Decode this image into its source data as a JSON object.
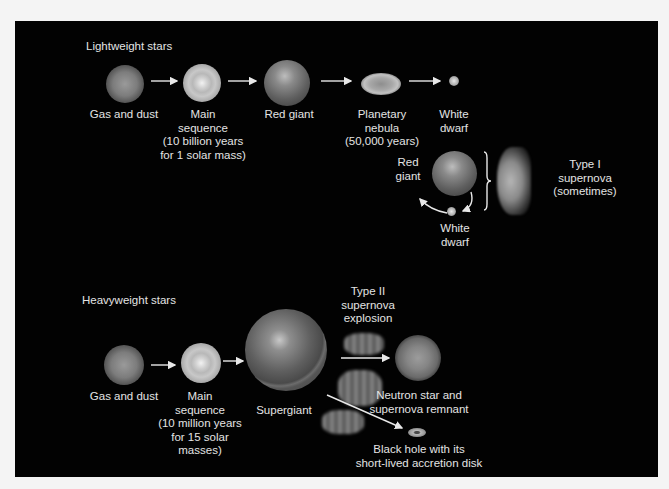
{
  "diagram": {
    "colors": {
      "background": "#020202",
      "page": "#f4f4f4",
      "text": "#e4e4e4",
      "arrow": "#e8e8e8"
    },
    "lightweight": {
      "heading": "Lightweight stars",
      "stages": [
        {
          "id": "gas-and-dust",
          "lines": [
            "Gas and dust"
          ]
        },
        {
          "id": "main-sequence",
          "lines": [
            "Main",
            "sequence",
            "(10 billion years",
            "for 1 solar mass)"
          ]
        },
        {
          "id": "red-giant",
          "lines": [
            "Red giant"
          ]
        },
        {
          "id": "planetary-nebula",
          "lines": [
            "Planetary",
            "nebula",
            "(50,000 years)"
          ]
        },
        {
          "id": "white-dwarf",
          "lines": [
            "White",
            "dwarf"
          ]
        }
      ],
      "binary": {
        "red_giant_lines": [
          "Red",
          "giant"
        ],
        "white_dwarf_lines": [
          "White",
          "dwarf"
        ],
        "result_lines": [
          "Type I",
          "supernova",
          "(sometimes)"
        ]
      }
    },
    "heavyweight": {
      "heading": "Heavyweight stars",
      "stages": [
        {
          "id": "gas-and-dust",
          "lines": [
            "Gas and dust"
          ]
        },
        {
          "id": "main-sequence",
          "lines": [
            "Main",
            "sequence",
            "(10 million years",
            "for 15 solar",
            "masses)"
          ]
        },
        {
          "id": "supergiant",
          "lines": [
            "Supergiant"
          ]
        }
      ],
      "explosion_lines": [
        "Type II",
        "supernova",
        "explosion"
      ],
      "outcomes": [
        {
          "id": "neutron-star",
          "lines": [
            "Neutron star and",
            "supernova remnant"
          ]
        },
        {
          "id": "black-hole",
          "lines": [
            "Black hole with its",
            "short-lived accretion disk"
          ]
        }
      ]
    }
  }
}
